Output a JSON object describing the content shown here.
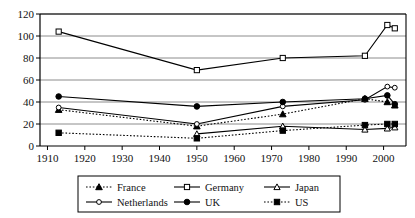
{
  "chart_data": {
    "type": "line",
    "title": "",
    "xlabel": "",
    "ylabel": "",
    "xlim": [
      1908,
      2006
    ],
    "ylim": [
      0,
      120
    ],
    "grid": true,
    "legend_position": "bottom",
    "xticks": [
      1910,
      1920,
      1930,
      1940,
      1950,
      1960,
      1970,
      1980,
      1990,
      2000
    ],
    "xtick_labels": [
      "1910",
      "1920",
      "1930",
      "1940",
      "1950",
      "1960",
      "1970",
      "1980",
      "1990",
      "2000"
    ],
    "yticks": [
      0,
      20,
      40,
      60,
      80,
      100,
      120
    ],
    "ytick_labels": [
      "0",
      "20",
      "40",
      "60",
      "80",
      "100",
      "120"
    ],
    "series": [
      {
        "name": "France",
        "line_style": "dotted",
        "marker": "filled-triangle",
        "x": [
          1913,
          1950,
          1973,
          1995,
          2001,
          2003
        ],
        "values": [
          33,
          18,
          29,
          43,
          40,
          37
        ]
      },
      {
        "name": "Germany",
        "line_style": "solid",
        "marker": "open-square",
        "x": [
          1913,
          1950,
          1973,
          1995,
          2001,
          2003
        ],
        "values": [
          104,
          69,
          80,
          82,
          110,
          107
        ]
      },
      {
        "name": "Japan",
        "line_style": "solid",
        "marker": "open-triangle",
        "x": [
          1913,
          1950,
          1973,
          1995,
          2001,
          2003
        ],
        "values": [
          null,
          11,
          18,
          15,
          16,
          17
        ]
      },
      {
        "name": "Netherlands",
        "line_style": "solid",
        "marker": "open-circle",
        "x": [
          1913,
          1950,
          1973,
          1995,
          2001,
          2003
        ],
        "values": [
          35,
          20,
          36,
          42,
          54,
          53
        ]
      },
      {
        "name": "UK",
        "line_style": "solid",
        "marker": "filled-circle",
        "x": [
          1913,
          1950,
          1973,
          1995,
          2001,
          2003
        ],
        "values": [
          45,
          36,
          40,
          43,
          46,
          38
        ]
      },
      {
        "name": "US",
        "line_style": "dotted",
        "marker": "filled-square",
        "x": [
          1913,
          1950,
          1973,
          1995,
          2001,
          2003
        ],
        "values": [
          12,
          7,
          14,
          19,
          20,
          20
        ]
      }
    ],
    "legend": [
      {
        "label": "France",
        "line_style": "dotted",
        "marker": "filled-triangle"
      },
      {
        "label": "Germany",
        "line_style": "solid",
        "marker": "open-square"
      },
      {
        "label": "Japan",
        "line_style": "solid",
        "marker": "open-triangle"
      },
      {
        "label": "Netherlands",
        "line_style": "solid",
        "marker": "open-circle"
      },
      {
        "label": "UK",
        "line_style": "solid",
        "marker": "filled-circle"
      },
      {
        "label": "US",
        "line_style": "dotted",
        "marker": "filled-square"
      }
    ],
    "colors": {
      "line": "#000000",
      "grid": "#808080",
      "axis": "#000000",
      "background": "#ffffff"
    }
  }
}
